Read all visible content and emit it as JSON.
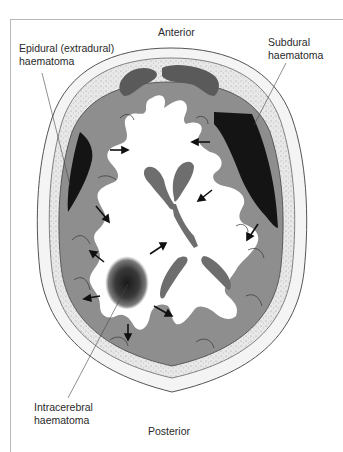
{
  "figure": {
    "type": "axial brain cross-section",
    "labels": {
      "anterior": "Anterior",
      "posterior": "Posterior",
      "epidural": [
        "Epidural (extradural)",
        "haematoma"
      ],
      "subdural": [
        "Subdural",
        "haematoma"
      ],
      "intracerebral": [
        "Intracerebral",
        "haematoma"
      ]
    },
    "colors": {
      "scalp": "#f2f2f2",
      "skull_outline": "#555555",
      "bone_stipple": "#e4e4e4",
      "grey_matter": "#8e8e8e",
      "white_matter": "#ffffff",
      "ventricles": "#6e6e6e",
      "haematoma": "#141414",
      "frontal_sinus": "#5a5a5a"
    }
  }
}
